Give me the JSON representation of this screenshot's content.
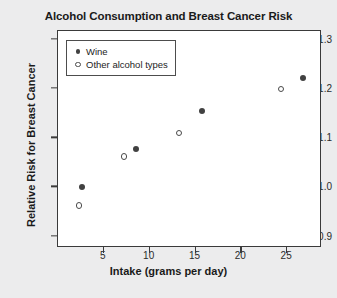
{
  "chart_data": {
    "type": "scatter",
    "title": "Alcohol Consumption and Breast Cancer Risk",
    "xlabel": "Intake (grams per day)",
    "ylabel": "Relative Risk for Breast Cancer",
    "xlim": [
      0.0,
      28.8
    ],
    "ylim": [
      0.877,
      1.318
    ],
    "xticks": [
      5,
      10,
      15,
      20,
      25
    ],
    "xtick_labels": [
      "5",
      "10",
      "15",
      "20",
      "25"
    ],
    "yticks": [
      0.9,
      1.0,
      1.1,
      1.2,
      1.3
    ],
    "ytick_labels": [
      "0.9",
      "1.0",
      "1.1",
      "1.2",
      "1.3"
    ],
    "grid": false,
    "legend_position": "upper left",
    "series": [
      {
        "name": "Wine",
        "marker": "filled-circle",
        "color": "#414141",
        "points": [
          {
            "x": 2.6,
            "y": 1.0
          },
          {
            "x": 8.5,
            "y": 1.079
          },
          {
            "x": 15.7,
            "y": 1.155
          },
          {
            "x": 26.7,
            "y": 1.223
          }
        ]
      },
      {
        "name": "Other alcohol types",
        "marker": "open-circle",
        "color": "#4a4a4a",
        "points": [
          {
            "x": 2.3,
            "y": 0.963
          },
          {
            "x": 7.2,
            "y": 1.063
          },
          {
            "x": 13.2,
            "y": 1.111
          },
          {
            "x": 24.3,
            "y": 1.2
          }
        ]
      }
    ]
  },
  "legend": {
    "items": [
      {
        "label": "Wine",
        "marker": "filled-circle"
      },
      {
        "label": "Other alcohol types",
        "marker": "open-circle"
      }
    ]
  },
  "colors": {
    "figure_background": "#ececed",
    "plot_background": "#ffffff",
    "axis": "#3a3a3a",
    "text": "#1a1a1a"
  }
}
